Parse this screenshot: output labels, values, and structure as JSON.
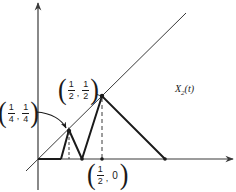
{
  "diagram": {
    "type": "piecewise-linear function plot with diagonal y = x",
    "function_label": {
      "name": "X",
      "subscript": "2",
      "argument": "(t)"
    },
    "points": [
      {
        "id": "quarter",
        "label": {
          "x_num": "1",
          "x_den": "4",
          "y_num": "1",
          "y_den": "4"
        }
      },
      {
        "id": "half",
        "label": {
          "x_num": "1",
          "x_den": "2",
          "y_num": "1",
          "y_den": "2"
        }
      },
      {
        "id": "half-zero",
        "label": {
          "x_num": "1",
          "x_den": "2",
          "y_value": "0"
        }
      }
    ],
    "colors": {
      "ink": "#1a1a1a",
      "axis": "#3a3a3a",
      "background": "#ffffff"
    }
  }
}
